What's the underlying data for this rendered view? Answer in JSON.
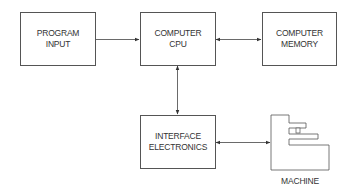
{
  "diagram": {
    "nodes": {
      "program_input": {
        "line1": "PROGRAM",
        "line2": "INPUT"
      },
      "computer_cpu": {
        "line1": "COMPUTER",
        "line2": "CPU"
      },
      "computer_memory": {
        "line1": "COMPUTER",
        "line2": "MEMORY"
      },
      "interface_electronics": {
        "line1": "INTERFACE",
        "line2": "ELECTRONICS"
      },
      "machine": {
        "label": "MACHINE"
      }
    },
    "edges": [
      {
        "from": "PROGRAM INPUT",
        "to": "COMPUTER CPU",
        "direction": "one-way"
      },
      {
        "from": "COMPUTER CPU",
        "to": "COMPUTER MEMORY",
        "direction": "two-way"
      },
      {
        "from": "COMPUTER CPU",
        "to": "INTERFACE ELECTRONICS",
        "direction": "two-way"
      },
      {
        "from": "INTERFACE ELECTRONICS",
        "to": "MACHINE",
        "direction": "two-way"
      }
    ]
  }
}
